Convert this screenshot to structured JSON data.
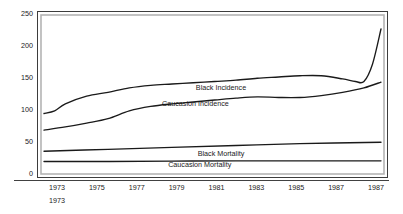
{
  "chart_data": {
    "type": "line",
    "title": "",
    "subtitle": "",
    "xlabel": "",
    "ylabel": "",
    "xlim": [
      1972,
      1987
    ],
    "ylim": [
      0,
      250
    ],
    "grid": false,
    "legend_position": "inline-labels",
    "y_ticks": [
      0,
      50,
      100,
      150,
      200,
      250
    ],
    "y_tick_labels": [
      "0",
      "50",
      "100",
      "150",
      "200",
      "250"
    ],
    "x_ticks": [
      1973,
      1975,
      1977,
      1979,
      1981,
      1983,
      1985,
      1987,
      1987
    ],
    "x_tick_labels": [
      "1973",
      "1975",
      "1977",
      "1979",
      "1981",
      "1983",
      "1985",
      "1987",
      "1987"
    ],
    "x_sub_tick_label": "1973",
    "series": [
      {
        "name": "Black Incidence",
        "label": "Black Incidence",
        "x": [
          1972.0,
          1972.5,
          1973.0,
          1974.0,
          1975.0,
          1976.0,
          1977.0,
          1978.0,
          1979.0,
          1980.0,
          1981.0,
          1982.0,
          1983.0,
          1984.0,
          1985.0,
          1986.0,
          1986.6,
          1987.0,
          1987.4,
          1987.8
        ],
        "values": [
          93,
          97,
          108,
          120,
          126,
          133,
          137,
          139,
          141,
          143,
          145,
          148,
          150,
          152,
          152,
          147,
          143,
          143,
          170,
          225
        ]
      },
      {
        "name": "Caucasion Incidence",
        "label": "Caucasion Incidence",
        "x": [
          1972.0,
          1973.0,
          1974.0,
          1975.0,
          1976.0,
          1977.0,
          1978.0,
          1979.0,
          1980.0,
          1981.0,
          1982.0,
          1983.0,
          1984.0,
          1985.0,
          1986.0,
          1987.0,
          1987.8
        ],
        "values": [
          67,
          72,
          78,
          85,
          97,
          104,
          108,
          111,
          114,
          117,
          119,
          118,
          118,
          121,
          126,
          133,
          142
        ]
      },
      {
        "name": "Black Mortality",
        "label": "Black Mortality",
        "x": [
          1972.0,
          1975.0,
          1978.0,
          1981.0,
          1984.0,
          1987.8
        ],
        "values": [
          34,
          37,
          40,
          43,
          46,
          48
        ]
      },
      {
        "name": "Caucasion Mortality",
        "label": "Caucasion Mortality",
        "x": [
          1972.0,
          1975.0,
          1978.0,
          1981.0,
          1984.0,
          1987.8
        ],
        "values": [
          18,
          18,
          18.5,
          19,
          19,
          19
        ]
      }
    ],
    "series_label_positions": [
      {
        "label": "Black Incidence",
        "x": 1980.3,
        "y": 130
      },
      {
        "label": "Caucasion Incidence",
        "x": 1979.1,
        "y": 105
      },
      {
        "label": "Black Mortality",
        "x": 1980.3,
        "y": 27
      },
      {
        "label": "Caucasion Mortality",
        "x": 1979.3,
        "y": 9
      }
    ],
    "colors": {
      "line": "#1a1a1a",
      "background": "#ffffff",
      "frame": "#3d3d3d",
      "frame_inner": "#b4b4b4",
      "text": "#1a1a1a"
    }
  }
}
